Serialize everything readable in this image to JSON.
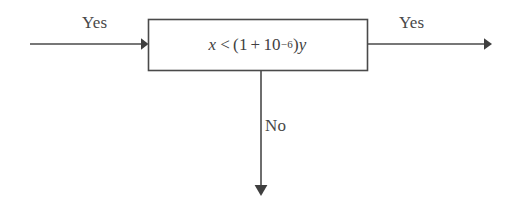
{
  "diagram": {
    "type": "flowchart-decision-fragment",
    "canvas": {
      "width": 519,
      "height": 205,
      "background": "#ffffff"
    },
    "stroke_color": "#4a4a4a",
    "text_color": "#484848",
    "decision_box": {
      "shape": "rectangle",
      "x": 148,
      "y": 19,
      "width": 220,
      "height": 52,
      "condition_text": "x < (1 + 10^-6)y",
      "formula": {
        "lhs_variable": "x",
        "relation": "<",
        "open_paren": "(",
        "base_term": "1",
        "plus": "+",
        "power_base": "10",
        "power_exponent": "−6",
        "close_paren": ")",
        "rhs_variable": "y"
      }
    },
    "edges": [
      {
        "id": "edge-in-left",
        "label": "Yes",
        "direction": "right",
        "from_x": 30,
        "to_x": 148,
        "y": 44,
        "arrowhead": "filled-triangle"
      },
      {
        "id": "edge-out-right",
        "label": "Yes",
        "direction": "right",
        "from_x": 368,
        "to_x": 492,
        "y": 44,
        "arrowhead": "filled-triangle"
      },
      {
        "id": "edge-out-bottom",
        "label": "No",
        "direction": "down",
        "x": 261,
        "from_y": 71,
        "to_y": 196,
        "arrowhead": "filled-triangle"
      }
    ]
  }
}
